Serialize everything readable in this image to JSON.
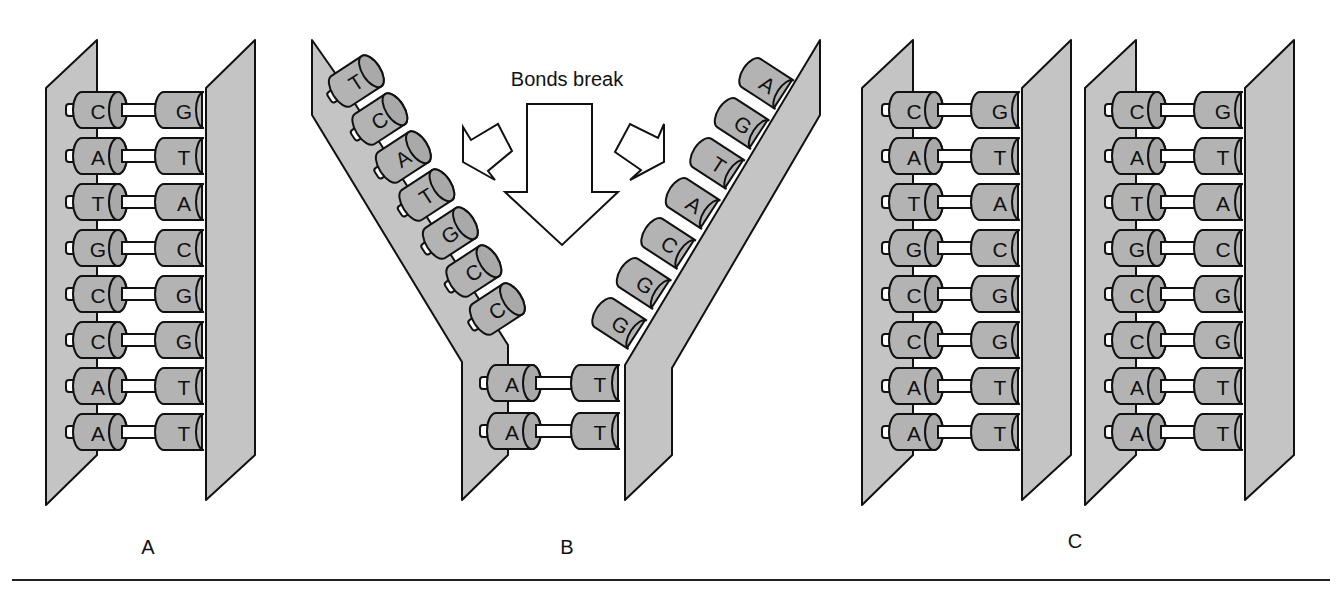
{
  "figure": {
    "title_annotation": "Bonds break",
    "panels": [
      {
        "id": "A",
        "label": "A",
        "state": "intact double strand",
        "pairs": [
          [
            "C",
            "G"
          ],
          [
            "A",
            "T"
          ],
          [
            "T",
            "A"
          ],
          [
            "G",
            "C"
          ],
          [
            "C",
            "G"
          ],
          [
            "C",
            "G"
          ],
          [
            "A",
            "T"
          ],
          [
            "A",
            "T"
          ]
        ]
      },
      {
        "id": "B",
        "label": "B",
        "state": "unzipping",
        "left_strand_separated": [
          "T",
          "C",
          "A",
          "T",
          "G",
          "C",
          "C"
        ],
        "right_strand_separated": [
          "A",
          "G",
          "T",
          "A",
          "C",
          "G",
          "G"
        ],
        "pairs_still_bonded": [
          [
            "A",
            "T"
          ],
          [
            "A",
            "T"
          ]
        ]
      },
      {
        "id": "C",
        "label": "C",
        "state": "two daughter double strands",
        "molecules": [
          {
            "pairs": [
              [
                "C",
                "G"
              ],
              [
                "A",
                "T"
              ],
              [
                "T",
                "A"
              ],
              [
                "G",
                "C"
              ],
              [
                "C",
                "G"
              ],
              [
                "C",
                "G"
              ],
              [
                "A",
                "T"
              ],
              [
                "A",
                "T"
              ]
            ]
          },
          {
            "pairs": [
              [
                "C",
                "G"
              ],
              [
                "A",
                "T"
              ],
              [
                "T",
                "A"
              ],
              [
                "G",
                "C"
              ],
              [
                "C",
                "G"
              ],
              [
                "C",
                "G"
              ],
              [
                "A",
                "T"
              ],
              [
                "A",
                "T"
              ]
            ]
          }
        ]
      }
    ],
    "colors": {
      "plank": "#c4c4c4",
      "base_body": "#b3b3b3",
      "outline": "#111111",
      "rod": "#ffffff"
    }
  }
}
